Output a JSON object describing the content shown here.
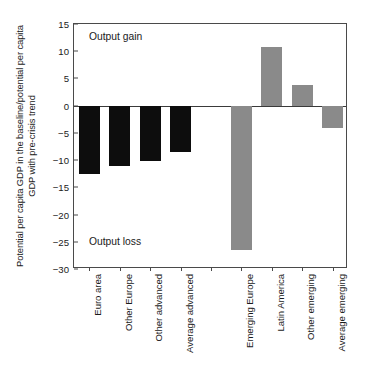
{
  "chart_data": {
    "type": "bar",
    "title": "",
    "xlabel": "",
    "ylabel": "Potential per capita GDP in the baseline/potential per capita GDP with pre-crisis trend",
    "ylim": [
      -30,
      15
    ],
    "yticks": [
      15,
      10,
      5,
      0,
      -5,
      -10,
      -15,
      -20,
      -25,
      -30
    ],
    "ytick_labels": [
      "15",
      "10",
      "5",
      "0",
      "−5",
      "−10",
      "−15",
      "−20",
      "−25",
      "−30"
    ],
    "grid": false,
    "legend": "none",
    "zero_line": 0,
    "categories": [
      "Euro area",
      "Other Europe",
      "Other advanced",
      "Average advanced",
      "",
      "Emerging Europe",
      "Latin America",
      "Other emerging",
      "Average emerging"
    ],
    "values": [
      -12.6,
      -11.0,
      -10.2,
      -8.5,
      null,
      -26.5,
      10.7,
      3.8,
      -4.1
    ],
    "bar_colors": [
      "#0d0d0d",
      "#0d0d0d",
      "#0d0d0d",
      "#0d0d0d",
      "",
      "#8a8a8a",
      "#8a8a8a",
      "#8a8a8a",
      "#8a8a8a"
    ],
    "groups": [
      {
        "name": "Advanced economies",
        "color": "#0d0d0d",
        "categories": [
          "Euro area",
          "Other Europe",
          "Other advanced",
          "Average advanced"
        ],
        "values": [
          -12.6,
          -11.0,
          -10.2,
          -8.5
        ]
      },
      {
        "name": "Emerging economies",
        "color": "#8a8a8a",
        "categories": [
          "Emerging Europe",
          "Latin America",
          "Other emerging",
          "Average emerging"
        ],
        "values": [
          -26.5,
          10.7,
          3.8,
          -4.1
        ]
      }
    ],
    "annotations": [
      {
        "text": "Output gain",
        "position": "top-left"
      },
      {
        "text": "Output loss",
        "position": "bottom-left"
      }
    ]
  },
  "axis": {
    "y_title": "Potential per capita GDP in the baseline/potential per capita GDP with pre-crisis trend"
  },
  "annotations": {
    "output_gain": "Output gain",
    "output_loss": "Output loss"
  },
  "caption": ""
}
